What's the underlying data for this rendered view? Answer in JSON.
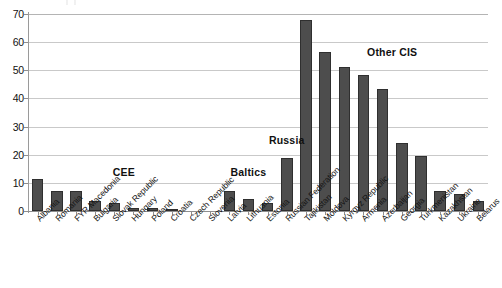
{
  "chart_data": {
    "type": "bar",
    "title": "",
    "subtitle": "",
    "xlabel": "",
    "ylabel": "",
    "ylim": [
      0,
      70
    ],
    "yticks": [
      0,
      10,
      20,
      30,
      40,
      50,
      60,
      70
    ],
    "grid": true,
    "legend": "none",
    "bar_color": "#4d4d4d",
    "bar_edge_color": "#2f2f2f",
    "gridline_color": "#c9c9c9",
    "axis_color": "#8e8e8e",
    "categories": [
      "Albania",
      "Romania",
      "FYR Macedonia",
      "Bulgaria",
      "Slovak Republic",
      "Hungary",
      "Poland",
      "Croatia",
      "Czech Republic",
      "Slovenia",
      "Latvia",
      "Lithuania",
      "Estonia",
      "Russian Federation",
      "Tajikistan",
      "Moldova",
      "Kyrgyz Republic",
      "Armenia",
      "Azerbaijan",
      "Georgia",
      "Turkmenistan",
      "Kazakhstan",
      "Ukraine",
      "Belarus"
    ],
    "values": [
      11.5,
      7.0,
      7.0,
      3.4,
      2.7,
      1.0,
      0.9,
      0.5,
      0.2,
      0.0,
      7.0,
      4.3,
      2.8,
      19.0,
      68.0,
      56.5,
      51.0,
      48.5,
      43.5,
      24.0,
      19.5,
      7.0,
      6.0,
      3.5
    ],
    "annotations": [
      {
        "text": "CEE",
        "category_span": [
          0,
          9
        ],
        "value": 13.5
      },
      {
        "text": "Baltics",
        "category_span": [
          10,
          12
        ],
        "value": 13.5
      },
      {
        "text": "Russia",
        "category_span": [
          13,
          13
        ],
        "value": 25.0
      },
      {
        "text": "Other CIS",
        "category_span": [
          14,
          23
        ],
        "value": 56.0
      }
    ],
    "groups": [
      {
        "name": "CEE",
        "members": [
          "Albania",
          "Romania",
          "FYR Macedonia",
          "Bulgaria",
          "Slovak Republic",
          "Hungary",
          "Poland",
          "Croatia",
          "Czech Republic",
          "Slovenia"
        ]
      },
      {
        "name": "Baltics",
        "members": [
          "Latvia",
          "Lithuania",
          "Estonia"
        ]
      },
      {
        "name": "Russia",
        "members": [
          "Russian Federation"
        ]
      },
      {
        "name": "Other CIS",
        "members": [
          "Tajikistan",
          "Moldova",
          "Kyrgyz Republic",
          "Armenia",
          "Azerbaijan",
          "Georgia",
          "Turkmenistan",
          "Kazakhstan",
          "Ukraine",
          "Belarus"
        ]
      }
    ]
  }
}
